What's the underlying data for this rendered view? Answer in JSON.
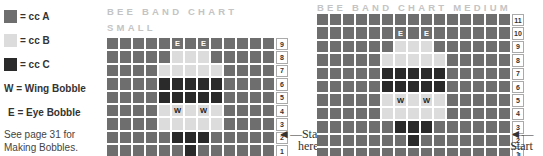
{
  "legend": {
    "items": [
      {
        "key": "A",
        "label": "= cc A",
        "color": "#6e6e6e"
      },
      {
        "key": "B",
        "label": "= cc B",
        "color": "#dcdcdc"
      },
      {
        "key": "C",
        "label": "= cc C",
        "color": "#2a2a2a"
      },
      {
        "key": "W",
        "label": "W = Wing Bobble"
      },
      {
        "key": "E",
        "label": "E = Eye Bobble"
      }
    ],
    "note_line1": "See page 31 for",
    "note_line2": "Making Bobbles."
  },
  "small_chart": {
    "title_line1": "BEE BAND CHART",
    "title_line2": "SMALL",
    "columns": [
      "13",
      "12",
      "11",
      "10",
      "9",
      "8",
      "7",
      "6",
      "5",
      "4",
      "3",
      "2",
      "1"
    ],
    "rows": [
      {
        "num": "9",
        "cells": [
          "A",
          "A",
          "A",
          "A",
          "A",
          "E",
          "A",
          "E",
          "A",
          "A",
          "A",
          "A",
          "A"
        ]
      },
      {
        "num": "8",
        "cells": [
          "A",
          "A",
          "A",
          "A",
          "A",
          "B",
          "B",
          "B",
          "A",
          "A",
          "A",
          "A",
          "A"
        ]
      },
      {
        "num": "7",
        "cells": [
          "A",
          "A",
          "A",
          "A",
          "B",
          "B",
          "B",
          "B",
          "B",
          "A",
          "A",
          "A",
          "A"
        ]
      },
      {
        "num": "6",
        "cells": [
          "A",
          "A",
          "A",
          "A",
          "C",
          "C",
          "C",
          "C",
          "C",
          "A",
          "A",
          "A",
          "A"
        ]
      },
      {
        "num": "5",
        "cells": [
          "A",
          "A",
          "A",
          "A",
          "C",
          "C",
          "C",
          "C",
          "C",
          "A",
          "A",
          "A",
          "A"
        ]
      },
      {
        "num": "4",
        "cells": [
          "A",
          "A",
          "A",
          "A",
          "B",
          "W",
          "B",
          "W",
          "B",
          "A",
          "A",
          "A",
          "A"
        ]
      },
      {
        "num": "3",
        "cells": [
          "A",
          "A",
          "A",
          "A",
          "B",
          "B",
          "B",
          "B",
          "B",
          "A",
          "A",
          "A",
          "A"
        ]
      },
      {
        "num": "2",
        "cells": [
          "A",
          "A",
          "A",
          "A",
          "A",
          "C",
          "C",
          "C",
          "A",
          "A",
          "A",
          "A",
          "A"
        ]
      },
      {
        "num": "1",
        "cells": [
          "A",
          "A",
          "A",
          "A",
          "A",
          "A",
          "C",
          "A",
          "A",
          "A",
          "A",
          "A",
          "A"
        ]
      }
    ],
    "start_line1": "Start",
    "start_line2": "here",
    "arrow": "◄—"
  },
  "medium_chart": {
    "title": "BEE BAND CHART MEDIUM",
    "columns": [
      "15",
      "14",
      "13",
      "12",
      "11",
      "10",
      "9",
      "8",
      "7",
      "6",
      "5",
      "4",
      "3",
      "2",
      "1"
    ],
    "rows": [
      {
        "num": "11",
        "cells": [
          "A",
          "A",
          "A",
          "A",
          "A",
          "A",
          "A",
          "A",
          "A",
          "A",
          "A",
          "A",
          "A",
          "A",
          "A"
        ]
      },
      {
        "num": "10",
        "cells": [
          "A",
          "A",
          "A",
          "A",
          "A",
          "A",
          "E",
          "A",
          "E",
          "A",
          "A",
          "A",
          "A",
          "A",
          "A"
        ]
      },
      {
        "num": "9",
        "cells": [
          "A",
          "A",
          "A",
          "A",
          "A",
          "A",
          "B",
          "B",
          "B",
          "A",
          "A",
          "A",
          "A",
          "A",
          "A"
        ]
      },
      {
        "num": "8",
        "cells": [
          "A",
          "A",
          "A",
          "A",
          "A",
          "B",
          "B",
          "B",
          "B",
          "B",
          "A",
          "A",
          "A",
          "A",
          "A"
        ]
      },
      {
        "num": "7",
        "cells": [
          "A",
          "A",
          "A",
          "A",
          "A",
          "C",
          "C",
          "C",
          "C",
          "C",
          "A",
          "A",
          "A",
          "A",
          "A"
        ]
      },
      {
        "num": "6",
        "cells": [
          "A",
          "A",
          "A",
          "A",
          "A",
          "C",
          "C",
          "C",
          "C",
          "C",
          "A",
          "A",
          "A",
          "A",
          "A"
        ]
      },
      {
        "num": "5",
        "cells": [
          "A",
          "A",
          "A",
          "A",
          "A",
          "B",
          "W",
          "B",
          "W",
          "B",
          "A",
          "A",
          "A",
          "A",
          "A"
        ]
      },
      {
        "num": "4",
        "cells": [
          "A",
          "A",
          "A",
          "A",
          "A",
          "B",
          "B",
          "B",
          "B",
          "B",
          "A",
          "A",
          "A",
          "A",
          "A"
        ]
      },
      {
        "num": "3",
        "cells": [
          "A",
          "A",
          "A",
          "A",
          "A",
          "A",
          "C",
          "C",
          "C",
          "A",
          "A",
          "A",
          "A",
          "A",
          "A"
        ]
      },
      {
        "num": "2",
        "cells": [
          "A",
          "A",
          "A",
          "A",
          "A",
          "A",
          "A",
          "C",
          "A",
          "A",
          "A",
          "A",
          "A",
          "A",
          "A"
        ]
      },
      {
        "num": "1",
        "cells": [
          "A",
          "A",
          "A",
          "A",
          "A",
          "A",
          "A",
          "A",
          "A",
          "A",
          "A",
          "A",
          "A",
          "A",
          "A"
        ]
      }
    ],
    "start_line1": "Start",
    "start_line2": "here",
    "arrow": "◄—"
  }
}
